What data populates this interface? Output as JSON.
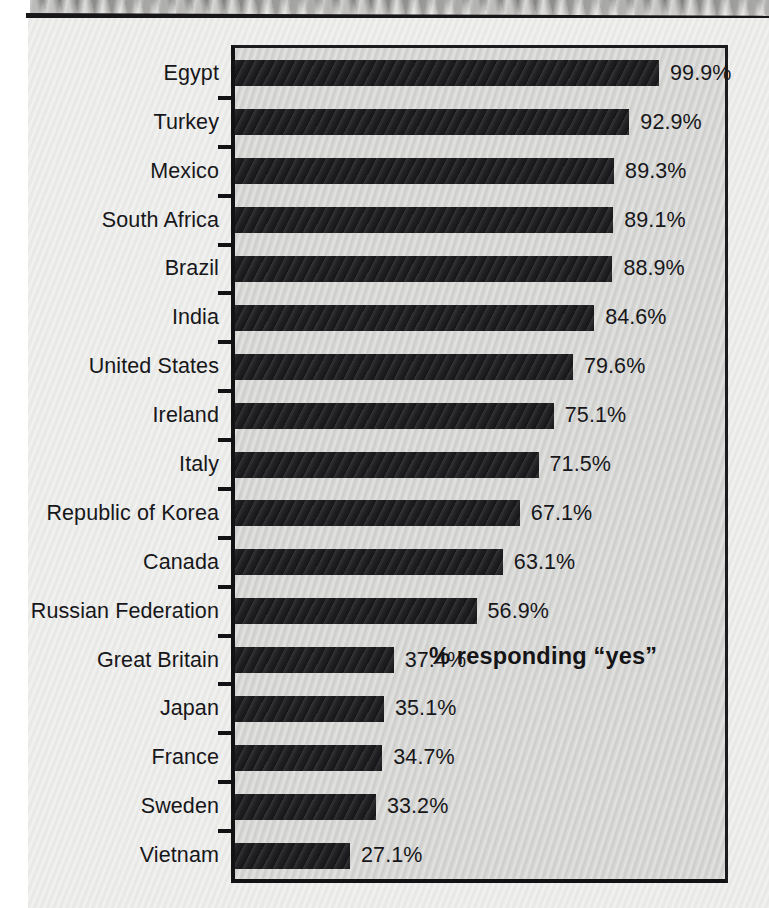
{
  "figure": {
    "annotation": "% responding “yes”",
    "plot_background_color": "#d3d3d1",
    "page_background_color": "#e9e9e7",
    "bar_color": "#1d1d20",
    "axis_color": "#121214",
    "text_color": "#17171a"
  },
  "chart_data": {
    "type": "bar",
    "orientation": "horizontal",
    "title": "",
    "subtitle": "",
    "xlabel": "",
    "ylabel": "",
    "annotations": [
      "% responding “yes”"
    ],
    "legend": [],
    "legend_position": "none",
    "grid": false,
    "xlim": [
      0,
      100
    ],
    "axis_ticks_visible": true,
    "value_label_format": "{value}%",
    "categories": [
      "Egypt",
      "Turkey",
      "Mexico",
      "South Africa",
      "Brazil",
      "India",
      "United States",
      "Ireland",
      "Italy",
      "Republic of Korea",
      "Canada",
      "Russian Federation",
      "Great Britain",
      "Japan",
      "France",
      "Sweden",
      "Vietnam"
    ],
    "values": [
      99.9,
      92.9,
      89.3,
      89.1,
      88.9,
      84.6,
      79.6,
      75.1,
      71.5,
      67.1,
      63.1,
      56.9,
      37.4,
      35.1,
      34.7,
      33.2,
      27.1
    ],
    "value_labels": [
      "99.9%",
      "92.9%",
      "89.3%",
      "89.1%",
      "88.9%",
      "84.6%",
      "79.6%",
      "75.1%",
      "71.5%",
      "67.1%",
      "63.1%",
      "56.9%",
      "37.4%",
      "35.1%",
      "34.7%",
      "33.2%",
      "27.1%"
    ]
  }
}
